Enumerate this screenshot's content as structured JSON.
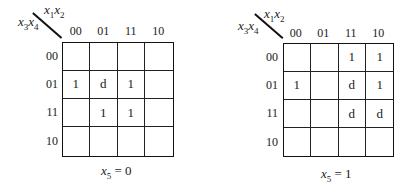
{
  "diagram": {
    "type": "karnaugh-map",
    "column_variables": "x1x2",
    "row_variables": "x3x4",
    "column_labels": [
      "00",
      "01",
      "11",
      "10"
    ],
    "row_labels": [
      "00",
      "01",
      "11",
      "10"
    ],
    "maps": [
      {
        "caption_var": "x",
        "caption_sub": "5",
        "caption_rest": " = 0",
        "cells": [
          [
            "",
            "",
            "",
            ""
          ],
          [
            "1",
            "d",
            "1",
            ""
          ],
          [
            "",
            "1",
            "1",
            ""
          ],
          [
            "",
            "",
            "",
            ""
          ]
        ]
      },
      {
        "caption_var": "x",
        "caption_sub": "5",
        "caption_rest": " = 1",
        "cells": [
          [
            "",
            "",
            "1",
            "1"
          ],
          [
            "1",
            "",
            "d",
            "1"
          ],
          [
            "",
            "",
            "d",
            "d"
          ],
          [
            "",
            "",
            "",
            ""
          ]
        ]
      }
    ]
  },
  "labels": {
    "col_var_x": "x",
    "col_var_1": "1",
    "col_var_2": "2",
    "row_var_3": "3",
    "row_var_4": "4"
  }
}
